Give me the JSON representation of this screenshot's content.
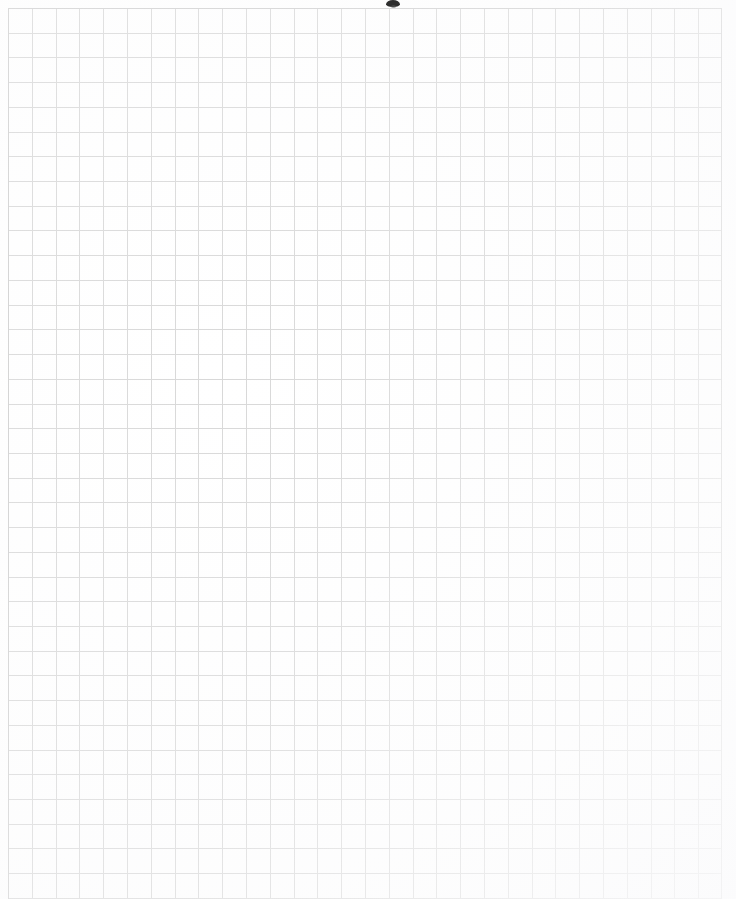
{
  "document": {
    "type": "scanned-graph-paper",
    "title": "Blank graph paper sheet",
    "description": "A scanned blank sheet of square-ruled graph paper. No text, labels, numbers or handwriting are present anywhere on the page.",
    "text_content": "",
    "page_width_px": 736,
    "page_height_px": 899
  },
  "paper": {
    "background_color": "#ffffff",
    "margin_left_px": 8,
    "margin_top_px": 8,
    "margin_right_px": 14,
    "margin_bottom_px": 0
  },
  "grid": {
    "kind": "square-ruled",
    "line_color": "#d8d8d8",
    "edge_line_color": "#cfcfcf",
    "line_width_px": 1,
    "cell_width_px": 23.8,
    "cell_height_px": 24.72,
    "columns": 30,
    "rows": 36,
    "origin_x_px": 8,
    "origin_y_px": 8,
    "block_width_px": 714,
    "block_height_px": 891,
    "bleeds_off_bottom": true,
    "bleeds_off_right": false
  },
  "artifacts": {
    "smudge": {
      "name": "scan-smudge",
      "color": "#1d1d1d",
      "x_px": 386,
      "y_px": 0,
      "width_px": 14,
      "height_px": 7,
      "note": "small dark scanner mark at top centre of the page"
    },
    "wash": {
      "name": "lower-right-fade",
      "note": "grid rules fade and lighten toward the lower-right corner"
    }
  }
}
